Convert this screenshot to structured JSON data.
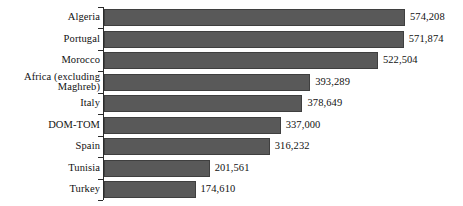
{
  "chart_data": {
    "type": "bar",
    "orientation": "horizontal",
    "title": "",
    "subtitle": "",
    "xlabel": "",
    "ylabel": "",
    "grid": false,
    "legend": false,
    "legend_position": "none",
    "axis_visible": "y-axis-left-with-ticks",
    "xlim": [
      0,
      574208
    ],
    "value_format": "comma-separated-integer",
    "bar_color": "#595959",
    "bar_outline_color": "#3f3f3f",
    "background_color": "#ffffff",
    "text_color": "#111111",
    "categories": [
      "Algeria",
      "Portugal",
      "Morocco",
      "Africa (excluding\nMaghreb)",
      "Italy",
      "DOM-TOM",
      "Spain",
      "Tunisia",
      "Turkey"
    ],
    "values": [
      574208,
      571874,
      522504,
      393289,
      378649,
      337000,
      316232,
      201561,
      174610
    ],
    "value_labels": [
      "574,208",
      "571,874",
      "522,504",
      "393,289",
      "378,649",
      "337,000",
      "316,232",
      "201,561",
      "174,610"
    ]
  },
  "layout": {
    "plot_left_px": 104,
    "px_per_unit": 0.000525,
    "bar_height_px": 17,
    "row_pitch_px": 21.5,
    "first_row_top_px": 9,
    "value_gap_px": 5
  }
}
